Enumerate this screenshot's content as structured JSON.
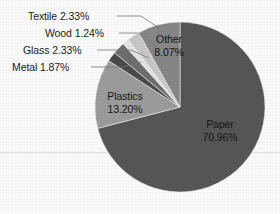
{
  "chart_data": {
    "type": "pie",
    "title": "",
    "legend_position": "none",
    "grid": false,
    "total_percent": 100.0,
    "categories": [
      "Paper",
      "Plastics",
      "Other",
      "Textile",
      "Glass",
      "Metal",
      "Wood"
    ],
    "values": [
      70.96,
      13.2,
      8.07,
      2.33,
      2.33,
      1.87,
      1.24
    ],
    "slices": [
      {
        "name": "Paper",
        "value": 70.96,
        "label": "Paper",
        "value_label": "70.96%",
        "color": "#575757",
        "label_placement": "inside",
        "start_angle_deg": 0,
        "end_angle_deg": 255.456
      },
      {
        "name": "Plastics",
        "value": 13.2,
        "label": "Plastics",
        "value_label": "13.20%",
        "color": "#9d9d9d",
        "label_placement": "inside",
        "start_angle_deg": 255.456,
        "end_angle_deg": 302.976
      },
      {
        "name": "Metal",
        "value": 1.87,
        "label": "Metal",
        "value_label": "1.87%",
        "color": "#4b4b4b",
        "label_placement": "outside",
        "start_angle_deg": 302.976,
        "end_angle_deg": 309.708
      },
      {
        "name": "Glass",
        "value": 2.33,
        "label": "Glass",
        "value_label": "2.33%",
        "color": "#6f6f6f",
        "label_placement": "outside",
        "start_angle_deg": 309.708,
        "end_angle_deg": 318.096
      },
      {
        "name": "Wood",
        "value": 1.24,
        "label": "Wood",
        "value_label": "1.24%",
        "color": "#e6e6e6",
        "label_placement": "outside",
        "start_angle_deg": 318.096,
        "end_angle_deg": 322.56
      },
      {
        "name": "Textile",
        "value": 2.33,
        "label": "Textile",
        "value_label": "2.33%",
        "color": "#c9c9c9",
        "label_placement": "outside",
        "start_angle_deg": 322.56,
        "end_angle_deg": 330.948
      },
      {
        "name": "Other",
        "value": 8.07,
        "label": "Other",
        "value_label": "8.07%",
        "color": "#888888",
        "label_placement": "inside",
        "start_angle_deg": 330.948,
        "end_angle_deg": 360
      }
    ],
    "labels_external": [
      {
        "text": "Textile 2.33%"
      },
      {
        "text": "Wood 1.24%"
      },
      {
        "text": "Glass 2.33%"
      },
      {
        "text": "Metal 1.87%"
      }
    ],
    "labels_internal": [
      {
        "name_text": "Plastics",
        "value_text": "13.20%"
      },
      {
        "name_text": "Other",
        "value_text": "8.07%"
      },
      {
        "name_text": "Paper",
        "value_text": "70.96%"
      }
    ],
    "geometry": {
      "center_x": 180,
      "center_y": 107,
      "radius": 85,
      "start_at_top": true,
      "direction": "clockwise"
    },
    "style": {
      "background": "#fdfdfd",
      "gridline_color": "#e2e2e2",
      "label_color": "#1d1d1d",
      "leader_color": "#7a7a7a"
    }
  }
}
